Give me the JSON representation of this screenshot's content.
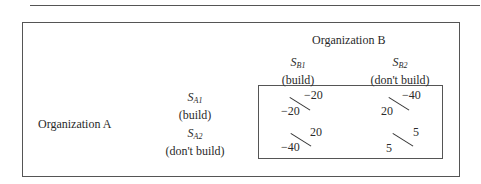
{
  "title_b": "Organization B",
  "title_a": "Organization A",
  "columns": [
    {
      "symbol": "S",
      "sub": "B1",
      "label": "(build)"
    },
    {
      "symbol": "S",
      "sub": "B2",
      "label": "(don't build)"
    }
  ],
  "rows": [
    {
      "symbol": "S",
      "sub": "A1",
      "label": "(build)"
    },
    {
      "symbol": "S",
      "sub": "A2",
      "label": "(don't build)"
    }
  ],
  "payoffs": [
    [
      {
        "a": "−20",
        "b": "−20"
      },
      {
        "a": "20",
        "b": "−40"
      }
    ],
    [
      {
        "a": "−40",
        "b": "20"
      },
      {
        "a": "5",
        "b": "5"
      }
    ]
  ]
}
